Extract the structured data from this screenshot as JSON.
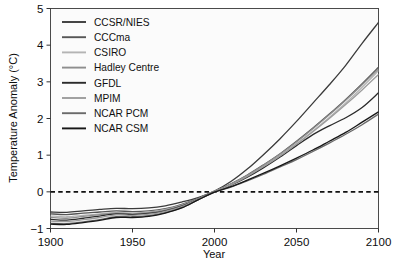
{
  "chart_data": {
    "type": "line",
    "title": "",
    "xlabel": "Year",
    "ylabel": "Temperature Anomaly (°C)",
    "xlim": [
      1900,
      2100
    ],
    "ylim": [
      -1,
      5
    ],
    "xticks": [
      1900,
      1950,
      2000,
      2050,
      2100
    ],
    "xtick_labels": [
      "1900",
      "1950",
      "2000",
      "2050",
      "2100"
    ],
    "yticks": [
      -1,
      0,
      1,
      2,
      3,
      4,
      5
    ],
    "ytick_labels": [
      "−1",
      "0",
      "1",
      "2",
      "3",
      "4",
      "5"
    ],
    "grid": false,
    "legend_position": "top-left-inside",
    "annotations": [
      {
        "type": "hline",
        "y": 0,
        "style": "dashed",
        "color": "#111111",
        "label": "zero anomaly reference"
      }
    ],
    "x": [
      1900,
      1910,
      1920,
      1930,
      1940,
      1950,
      1960,
      1970,
      1980,
      1990,
      2000,
      2010,
      2020,
      2030,
      2040,
      2050,
      2060,
      2070,
      2080,
      2090,
      2100
    ],
    "series": [
      {
        "name": "CCSR/NIES",
        "color": "#3b3b3b",
        "values": [
          -0.55,
          -0.56,
          -0.52,
          -0.48,
          -0.45,
          -0.46,
          -0.44,
          -0.38,
          -0.28,
          -0.16,
          0.02,
          0.28,
          0.62,
          1.02,
          1.45,
          1.92,
          2.42,
          2.92,
          3.45,
          4.05,
          4.62
        ]
      },
      {
        "name": "CCCma",
        "color": "#565656",
        "values": [
          -0.6,
          -0.62,
          -0.58,
          -0.55,
          -0.52,
          -0.54,
          -0.52,
          -0.46,
          -0.34,
          -0.18,
          0.02,
          0.22,
          0.46,
          0.74,
          1.04,
          1.38,
          1.74,
          2.12,
          2.52,
          2.95,
          3.4
        ]
      },
      {
        "name": "CSIRO",
        "color": "#b4b4b4",
        "values": [
          -0.66,
          -0.68,
          -0.64,
          -0.6,
          -0.57,
          -0.58,
          -0.55,
          -0.48,
          -0.36,
          -0.19,
          0.01,
          0.2,
          0.43,
          0.7,
          0.99,
          1.31,
          1.66,
          2.03,
          2.42,
          2.85,
          3.3
        ]
      },
      {
        "name": "Hadley Centre",
        "color": "#8e8e8e",
        "values": [
          -0.7,
          -0.72,
          -0.67,
          -0.62,
          -0.58,
          -0.6,
          -0.57,
          -0.5,
          -0.37,
          -0.19,
          0.01,
          0.21,
          0.45,
          0.73,
          1.03,
          1.36,
          1.72,
          2.1,
          2.5,
          2.92,
          3.35
        ]
      },
      {
        "name": "GFDL",
        "color": "#2b2b2b",
        "values": [
          -0.75,
          -0.77,
          -0.72,
          -0.66,
          -0.6,
          -0.62,
          -0.59,
          -0.52,
          -0.39,
          -0.2,
          0.0,
          0.18,
          0.4,
          0.66,
          0.95,
          1.26,
          1.56,
          1.8,
          2.02,
          2.3,
          2.7
        ]
      },
      {
        "name": "MPIM",
        "color": "#9c9c9c",
        "values": [
          -0.8,
          -0.81,
          -0.76,
          -0.7,
          -0.63,
          -0.64,
          -0.61,
          -0.53,
          -0.4,
          -0.2,
          0.0,
          0.19,
          0.42,
          0.69,
          0.98,
          1.3,
          1.64,
          2.0,
          2.38,
          2.78,
          3.2
        ]
      },
      {
        "name": "NCAR PCM",
        "color": "#6a6a6a",
        "values": [
          -0.86,
          -0.87,
          -0.82,
          -0.76,
          -0.68,
          -0.68,
          -0.65,
          -0.57,
          -0.43,
          -0.22,
          -0.01,
          0.13,
          0.3,
          0.48,
          0.68,
          0.88,
          1.1,
          1.33,
          1.57,
          1.83,
          2.12
        ]
      },
      {
        "name": "NCAR CSM",
        "color": "#171717",
        "values": [
          -0.88,
          -0.89,
          -0.84,
          -0.78,
          -0.7,
          -0.7,
          -0.67,
          -0.58,
          -0.44,
          -0.22,
          -0.01,
          0.14,
          0.32,
          0.51,
          0.71,
          0.92,
          1.14,
          1.38,
          1.62,
          1.9,
          2.18
        ]
      }
    ]
  },
  "legend": {
    "entries": [
      {
        "label": "CCSR/NIES"
      },
      {
        "label": "CCCma"
      },
      {
        "label": "CSIRO"
      },
      {
        "label": "Hadley Centre"
      },
      {
        "label": "GFDL"
      },
      {
        "label": "MPIM"
      },
      {
        "label": "NCAR PCM"
      },
      {
        "label": "NCAR CSM"
      }
    ]
  }
}
